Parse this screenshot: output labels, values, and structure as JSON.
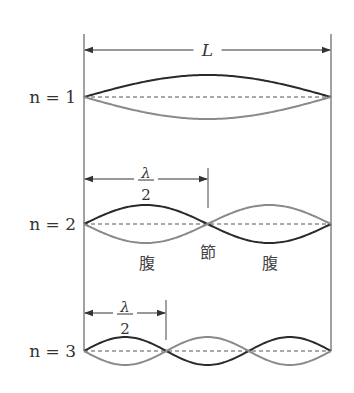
{
  "diagram": {
    "length_label": "L",
    "wavelength_label": {
      "numerator": "λ",
      "denominator": "2"
    },
    "node_label": "節",
    "antinode_label": "腹",
    "colors": {
      "phase_a": "#2a2a2a",
      "phase_b": "#8a8a8a",
      "baseline": "#555555",
      "frame": "#444444",
      "text": "#333333"
    },
    "geometry": {
      "x_left": 84,
      "x_right": 331,
      "frame_top": 34,
      "frame_bottom": 351
    },
    "modes": [
      {
        "n": 1,
        "label": "n = 1",
        "baseline_y": 97,
        "amplitude": 22
      },
      {
        "n": 2,
        "label": "n = 2",
        "baseline_y": 224,
        "amplitude": 19
      },
      {
        "n": 3,
        "label": "n = 3",
        "baseline_y": 351,
        "amplitude": 14
      }
    ],
    "annotations": {
      "length_arrow_y": 50,
      "n2_half_wave": {
        "arrow_y": 179,
        "tick_x": 208,
        "tick_top": 168,
        "tick_bottom": 208,
        "lambda_y": 173,
        "two_y": 195
      },
      "n3_half_wave": {
        "arrow_y": 313,
        "tick_x": 166,
        "tick_top": 300,
        "tick_bottom": 340,
        "lambda_y": 307,
        "two_y": 329
      },
      "node_pos": {
        "x": 208,
        "y": 252
      },
      "antinode_positions": [
        {
          "x": 147,
          "y": 263
        },
        {
          "x": 270,
          "y": 263
        }
      ]
    }
  }
}
